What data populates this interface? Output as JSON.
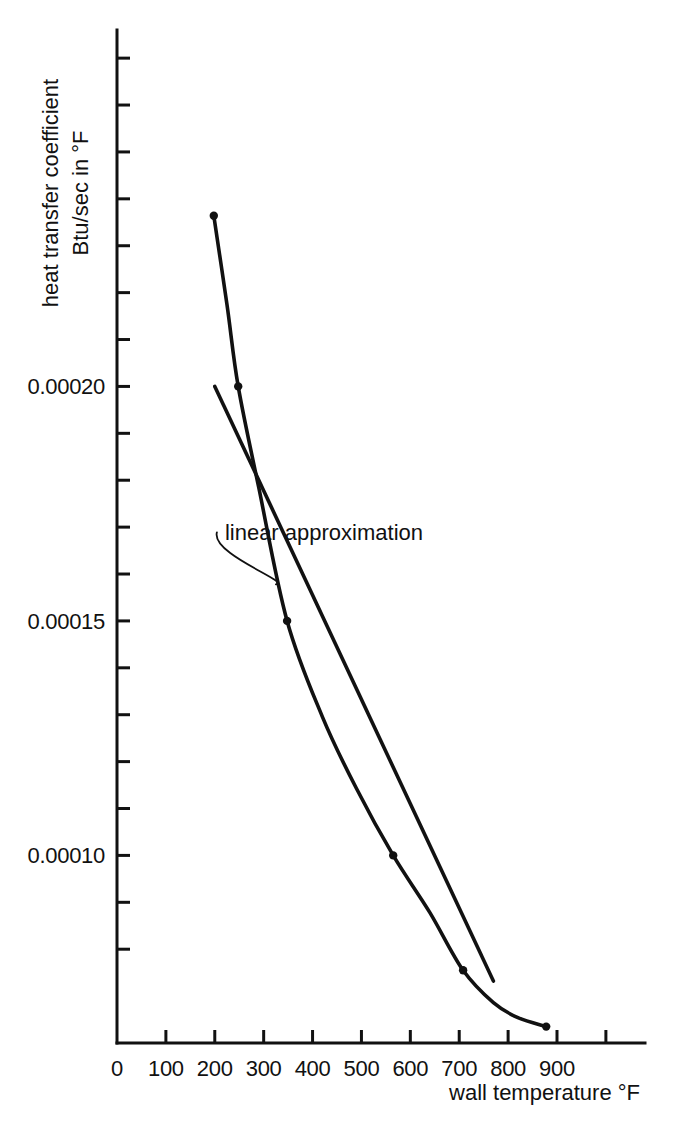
{
  "chart_data": {
    "type": "line",
    "title": "",
    "xlabel": "wall temperature °F",
    "ylabel_line1": "heat transfer coefficient",
    "ylabel_line2": "Btu/sec in °F",
    "xlim": [
      0,
      1080
    ],
    "ylim": [
      6e-05,
      0.000276
    ],
    "x_ticks": [
      0,
      100,
      200,
      300,
      400,
      500,
      600,
      700,
      800,
      900,
      1000
    ],
    "x_tick_labels": [
      "0",
      "100",
      "200",
      "300",
      "400",
      "500",
      "600",
      "700",
      "800",
      "900",
      ""
    ],
    "y_ticks": [
      8e-05,
      9e-05,
      0.0001,
      0.00011,
      0.00012,
      0.00013,
      0.00014,
      0.00015,
      0.00016,
      0.00017,
      0.00018,
      0.00019,
      0.0002,
      0.00021,
      0.00022,
      0.00023,
      0.00024,
      0.00025,
      0.00026,
      0.00027
    ],
    "y_tick_labels": {
      "0.00010": "0.00010",
      "0.00015": "0.00015",
      "0.00020": "0.00020"
    },
    "grid": false,
    "legend": "none",
    "series": [
      {
        "name": "measured curve",
        "style": "curve-with-markers",
        "x": [
          198,
          248,
          348,
          565,
          708,
          878
        ],
        "y": [
          0.0002364,
          0.0002,
          0.00015,
          0.0001,
          7.55e-05,
          6.35e-05
        ],
        "curve_x": [
          198,
          225,
          248,
          290,
          348,
          420,
          490,
          565,
          640,
          708,
          770,
          820,
          878
        ],
        "curve_y": [
          0.0002364,
          0.0002174,
          0.0002,
          0.0001784,
          0.00015,
          0.0001296,
          0.0001142,
          0.0001,
          8.78e-05,
          7.55e-05,
          6.86e-05,
          6.54e-05,
          6.35e-05
        ]
      },
      {
        "name": "linear approximation",
        "style": "straight-line",
        "x": [
          200,
          770
        ],
        "y": [
          0.0002,
          7.32e-05
        ]
      }
    ],
    "annotations": [
      {
        "text": "linear approximation",
        "target_x": 325,
        "target_y": 0.0001578,
        "label_x": 460,
        "label_y": 0.0001672
      }
    ],
    "colors": {
      "line": "#111111",
      "axis": "#111111",
      "background": "#ffffff"
    }
  },
  "axes": {
    "x_axis_name": "wall temperature",
    "y_axis_name": "heat transfer coefficient"
  }
}
